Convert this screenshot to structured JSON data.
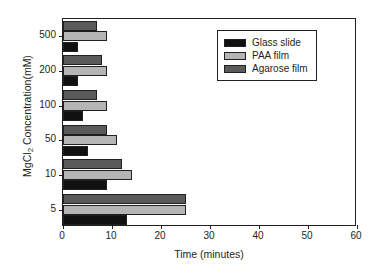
{
  "chart_data": {
    "type": "bar",
    "orientation": "horizontal",
    "title": "",
    "xlabel": "Time (minutes)",
    "ylabel": "MgCl2 Concentration(mM)",
    "ylabel_parts": {
      "pre": "MgCl",
      "sub": "2",
      "post": " Concentration(mM)"
    },
    "categories": [
      "500",
      "200",
      "100",
      "50",
      "10",
      "5"
    ],
    "xlim": [
      0,
      60
    ],
    "xticks": [
      0,
      10,
      20,
      30,
      40,
      50,
      60
    ],
    "xticklabels": [
      "0",
      "10",
      "20",
      "30",
      "40",
      "50",
      "60"
    ],
    "grid": false,
    "legend_position": "upper right",
    "series": [
      {
        "name": "Glass slide",
        "color": "#111111",
        "values": [
          3,
          3,
          4,
          5,
          9,
          13
        ]
      },
      {
        "name": "PAA film",
        "color": "#b5b5b5",
        "values": [
          9,
          9,
          9,
          11,
          14,
          25
        ]
      },
      {
        "name": "Agarose film",
        "color": "#5a5a5a",
        "values": [
          7,
          8,
          7,
          9,
          12,
          25
        ]
      }
    ]
  },
  "legend": {
    "entries": [
      {
        "label": "Glass slide",
        "color": "#111111"
      },
      {
        "label": "PAA film",
        "color": "#b5b5b5"
      },
      {
        "label": "Agarose film",
        "color": "#5a5a5a"
      }
    ]
  },
  "axes": {
    "frame_color": "#231f20",
    "background": "#ffffff"
  }
}
